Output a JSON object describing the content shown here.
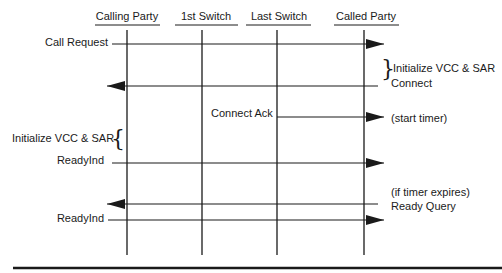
{
  "participants": [
    {
      "name": "Calling Party",
      "x": 127
    },
    {
      "name": "1st Switch",
      "x": 202
    },
    {
      "name": "Last Switch",
      "x": 277
    },
    {
      "name": "Called Party",
      "x": 364
    }
  ],
  "messages": [
    {
      "label": "Call Request",
      "direction": "right",
      "y": 44
    },
    {
      "label": "Connect",
      "direction": "left",
      "y": 86
    },
    {
      "label": "Connect Ack",
      "direction": "right",
      "y": 117
    },
    {
      "label": "ReadyInd",
      "direction": "right",
      "y": 163
    },
    {
      "label": "Ready Query",
      "direction": "left",
      "y": 204
    },
    {
      "label": "ReadyInd",
      "direction": "right",
      "y": 220
    }
  ],
  "annotations": {
    "init_called": "Initialize VCC & SAR",
    "init_calling": "Initialize VCC & SAR",
    "start_timer": "(start timer)",
    "if_timer_expires": "(if timer expires)"
  },
  "colors": {
    "line": "#1a1a1a",
    "background": "#ffffff"
  }
}
